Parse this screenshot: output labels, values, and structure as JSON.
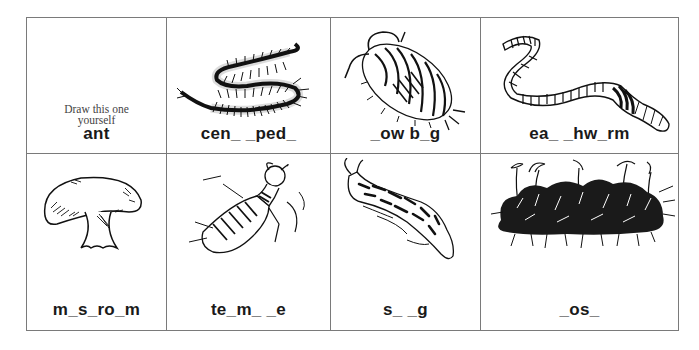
{
  "worksheet": {
    "cells": [
      {
        "row": 1,
        "col": 1,
        "subject": "ant",
        "instruction": [
          "Draw this one",
          "yourself"
        ],
        "label": "ant",
        "picture": "none"
      },
      {
        "row": 1,
        "col": 2,
        "subject": "centipede",
        "label": "cen_ _ped_",
        "picture": "centipede-illustration"
      },
      {
        "row": 1,
        "col": 3,
        "subject": "sow bug",
        "label": "_ow b_g",
        "picture": "sowbug-illustration"
      },
      {
        "row": 1,
        "col": 4,
        "subject": "earthworm",
        "label": "ea_ _hw_rm",
        "picture": "earthworm-illustration"
      },
      {
        "row": 2,
        "col": 1,
        "subject": "mushroom",
        "label": "m_s_ro_m",
        "picture": "mushroom-illustration"
      },
      {
        "row": 2,
        "col": 2,
        "subject": "termite",
        "label": "te_m_ _e",
        "picture": "termite-illustration"
      },
      {
        "row": 2,
        "col": 3,
        "subject": "slug",
        "label": "s_ _g",
        "picture": "slug-illustration"
      },
      {
        "row": 2,
        "col": 4,
        "subject": "moss",
        "label": "_os_",
        "picture": "moss-illustration"
      }
    ],
    "colors": {
      "line": "#7a7a7a",
      "ink": "#1a1a1a",
      "background": "#ffffff"
    }
  }
}
